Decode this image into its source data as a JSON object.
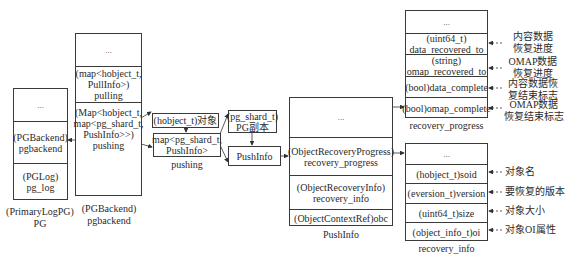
{
  "pg": {
    "sections": [
      "...",
      "(PGBackend)\npgbackend",
      "(PGLog)\npg_log"
    ],
    "caption_line1": "(PrimaryLogPG)",
    "caption_line2": "PG"
  },
  "pgbackend": {
    "sections": [
      "...",
      "(map<hobject_t,\nPullInfo>)\npulling",
      "(Map<hobject_t,\nmap<pg_shard_t,\nPushInfo>>)\npushing"
    ],
    "caption_line1": "(PGBackend)",
    "caption_line2": "pgbackend"
  },
  "pushing_detail": {
    "hobject_box": "(hobject_t)对象",
    "map_box_line1": "map<pg_shard_t,",
    "map_box_line2": "PushInfo>",
    "map_caption": "pushing",
    "pg_shard_box_line1": "(pg_shard_t)",
    "pg_shard_box_line2": "PG副本",
    "pushinfo_box": "PushInfo"
  },
  "pushinfo": {
    "sections": [
      "...",
      "(ObjectRecoveryProgress)\nrecovery_progress",
      "(ObjectRecoveryInfo)\nrecovery_info",
      "(ObjectContextRef)obc"
    ],
    "caption": "PushInfo"
  },
  "recovery_progress": {
    "sections": [
      "...",
      "(uint64_t)\ndata_recovered_to",
      "(string)\nomap_recovered_to",
      "(bool)data_complete",
      "(bool)omap_complete"
    ],
    "notes": [
      "内容数据\n恢复进度",
      "OMAP数据\n恢复进度",
      "内容数据恢\n复结束标志",
      "OMAP数据\n恢复结束标志"
    ],
    "caption": "recovery_progress"
  },
  "recovery_info": {
    "sections": [
      "...",
      "(hobject_t)soid",
      "(eversion_t)version",
      "(uint64_t)size",
      "(object_info_t)oi"
    ],
    "notes": [
      "对象名",
      "要恢复的版本",
      "对象大小",
      "对象OI属性"
    ],
    "caption": "recovery_info"
  }
}
